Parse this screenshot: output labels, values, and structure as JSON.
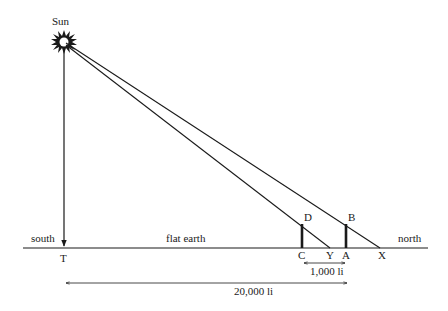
{
  "diagram": {
    "labels": {
      "sun": "Sun",
      "south": "south",
      "north": "north",
      "flat_earth": "flat earth",
      "T": "T",
      "C": "C",
      "Y": "Y",
      "A": "A",
      "X": "X",
      "D": "D",
      "B": "B"
    },
    "measurements": {
      "short_distance": "1,000 li",
      "long_distance": "20,000 li"
    },
    "colors": {
      "line": "#1a1a1a",
      "background": "#ffffff"
    },
    "elements": [
      {
        "name": "sun",
        "type": "point",
        "label": "Sun"
      },
      {
        "name": "ground",
        "type": "line",
        "label": "flat earth"
      },
      {
        "name": "sun-to-T",
        "type": "arrow",
        "from": "Sun",
        "to": "T"
      },
      {
        "name": "sun-to-X",
        "type": "ray",
        "from": "Sun",
        "through": "B",
        "to": "X"
      },
      {
        "name": "sun-to-Y",
        "type": "ray",
        "from": "Sun",
        "through": "D",
        "to": "Y"
      },
      {
        "name": "gnomon-CD",
        "type": "pole",
        "base": "C",
        "top": "D"
      },
      {
        "name": "gnomon-AB",
        "type": "pole",
        "base": "A",
        "top": "B"
      },
      {
        "name": "distance-CA",
        "type": "double-arrow",
        "label": "1,000 li"
      },
      {
        "name": "distance-TA",
        "type": "double-arrow",
        "label": "20,000 li"
      }
    ]
  }
}
